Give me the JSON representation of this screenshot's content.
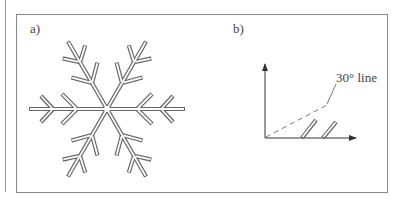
{
  "figure": {
    "panel_a": {
      "label": "a)",
      "content": "snowflake-dendrite",
      "arms": 6,
      "side_branches_per_side": 2
    },
    "panel_b": {
      "label": "b)",
      "annotation": "30° line",
      "axes": [
        "vertical-arrow",
        "horizontal-arrow"
      ],
      "dashed_line": "30-degree-line",
      "branches": 2
    },
    "colors": {
      "line": "#555555",
      "border": "#888888",
      "background": "#ffffff"
    }
  }
}
